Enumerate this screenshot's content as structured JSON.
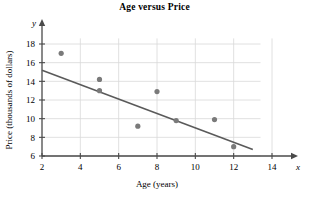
{
  "chart_data": {
    "type": "scatter",
    "title": "Age versus Price",
    "xlabel": "Age (years)",
    "ylabel": "Price (thousands of dollars)",
    "x_var": "x",
    "y_var": "y",
    "xlim": [
      2,
      14
    ],
    "ylim": [
      6,
      19
    ],
    "xticks": [
      2,
      4,
      6,
      8,
      10,
      12,
      14
    ],
    "yticks": [
      6,
      8,
      10,
      12,
      14,
      16,
      18
    ],
    "xtick_labels": [
      "2",
      "4",
      "6",
      "8",
      "10",
      "12",
      "14"
    ],
    "ytick_labels": [
      "6",
      "8",
      "10",
      "12",
      "14",
      "16",
      "18"
    ],
    "grid": true,
    "grid_color": "#d8d8d8",
    "point_color": "#7a7a7a",
    "line_color": "#5a5a5a",
    "axis_color": "#4a4a4a",
    "points": [
      {
        "x": 3,
        "y": 17.0
      },
      {
        "x": 5,
        "y": 14.2
      },
      {
        "x": 5,
        "y": 13.0
      },
      {
        "x": 7,
        "y": 9.2
      },
      {
        "x": 8,
        "y": 12.9
      },
      {
        "x": 9,
        "y": 9.8
      },
      {
        "x": 11,
        "y": 9.9
      },
      {
        "x": 12,
        "y": 7.0
      }
    ],
    "trend_line": {
      "name": "line of best fit",
      "x_start": 2,
      "y_start": 15.2,
      "x_end": 13,
      "y_end": 6.7
    }
  }
}
